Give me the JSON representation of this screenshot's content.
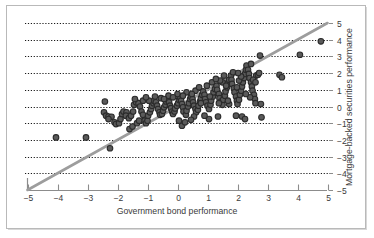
{
  "figure": {
    "background_color": "#ffffff",
    "frame_color": "#b9b9b9"
  },
  "chart_data": {
    "type": "scatter",
    "title": "",
    "xlabel": "Government bond performance",
    "ylabel": "Mortgage-backed securities performance",
    "xlim": [
      -5,
      5
    ],
    "ylim": [
      -5,
      5
    ],
    "xticks": [
      -5,
      -4,
      -3,
      -2,
      -1,
      0,
      1,
      2,
      3,
      4,
      5
    ],
    "xticklabels": [
      "−5",
      "−4",
      "−3",
      "−2",
      "−1",
      "0",
      "1",
      "2",
      "3",
      "4",
      "5"
    ],
    "yticks": [
      -5,
      -4,
      -3,
      -2,
      -1,
      0,
      1,
      2,
      3,
      4,
      5
    ],
    "yticklabels": [
      "−5",
      "−4",
      "−3",
      "−2",
      "−1",
      "0",
      "1",
      "2",
      "3",
      "4",
      "5"
    ],
    "yaxis_position": "right",
    "grid": {
      "horizontal": true,
      "vertical": false,
      "style": "dotted",
      "color": "#1a1a1a",
      "levels": [
        -4,
        -3,
        -2,
        -1,
        0,
        1,
        2,
        3,
        4,
        5
      ]
    },
    "legend": null,
    "marker": {
      "shape": "circle",
      "fill_color": "#5a5a5a",
      "edge_color": "#2b2b2b",
      "size_px": 5.6
    },
    "trendline": {
      "name": "identity-line",
      "color": "#9d9d9d",
      "width_px": 2.6,
      "slope": 1,
      "intercept": 0,
      "x_start": -5,
      "y_start": -5,
      "x_end": 5,
      "y_end": 5
    },
    "points": [
      [
        -4.05,
        -1.85
      ],
      [
        -3.05,
        -1.85
      ],
      [
        -2.42,
        0.3
      ],
      [
        -2.45,
        -0.35
      ],
      [
        -2.38,
        -0.55
      ],
      [
        -2.3,
        -0.6
      ],
      [
        -2.2,
        -0.62
      ],
      [
        -2.3,
        -0.75
      ],
      [
        -2.25,
        -2.5
      ],
      [
        -2.1,
        -0.95
      ],
      [
        -2.05,
        -1.05
      ],
      [
        -1.95,
        -1.0
      ],
      [
        -1.9,
        -0.75
      ],
      [
        -1.85,
        -0.45
      ],
      [
        -1.8,
        -0.3
      ],
      [
        -1.7,
        -0.35
      ],
      [
        -1.72,
        -0.55
      ],
      [
        -1.62,
        -0.7
      ],
      [
        -1.55,
        -0.55
      ],
      [
        -1.48,
        -0.3
      ],
      [
        -1.45,
        0.1
      ],
      [
        -1.38,
        0.25
      ],
      [
        -1.3,
        0.2
      ],
      [
        -1.25,
        0.0
      ],
      [
        -1.2,
        -0.3
      ],
      [
        -1.15,
        -0.5
      ],
      [
        -1.1,
        -0.85
      ],
      [
        -1.05,
        -1.0
      ],
      [
        -1.0,
        -0.85
      ],
      [
        -0.98,
        -0.55
      ],
      [
        -0.92,
        -0.35
      ],
      [
        -0.88,
        -0.15
      ],
      [
        -0.85,
        0.05
      ],
      [
        -0.8,
        0.2
      ],
      [
        -0.78,
        0.35
      ],
      [
        -0.72,
        0.25
      ],
      [
        -0.68,
        0.05
      ],
      [
        -0.65,
        -0.15
      ],
      [
        -0.6,
        -0.35
      ],
      [
        -0.58,
        -0.5
      ],
      [
        -0.52,
        -0.45
      ],
      [
        -0.48,
        -0.25
      ],
      [
        -0.45,
        -0.05
      ],
      [
        -0.4,
        0.1
      ],
      [
        -0.38,
        0.3
      ],
      [
        -0.32,
        0.4
      ],
      [
        -0.28,
        0.25
      ],
      [
        -0.25,
        0.05
      ],
      [
        -0.22,
        -0.1
      ],
      [
        -0.18,
        -0.3
      ],
      [
        -0.15,
        -0.45
      ],
      [
        -0.1,
        -0.3
      ],
      [
        -0.08,
        -0.12
      ],
      [
        -0.02,
        0.05
      ],
      [
        0.02,
        0.2
      ],
      [
        0.05,
        0.4
      ],
      [
        0.08,
        0.55
      ],
      [
        0.12,
        0.35
      ],
      [
        0.15,
        0.15
      ],
      [
        0.18,
        -0.05
      ],
      [
        0.2,
        -0.3
      ],
      [
        0.15,
        -1.15
      ],
      [
        0.25,
        -0.95
      ],
      [
        0.28,
        -0.5
      ],
      [
        0.3,
        -0.25
      ],
      [
        0.35,
        0.0
      ],
      [
        0.38,
        0.2
      ],
      [
        0.42,
        0.45
      ],
      [
        0.45,
        0.6
      ],
      [
        0.5,
        0.45
      ],
      [
        0.52,
        0.25
      ],
      [
        0.55,
        0.05
      ],
      [
        0.6,
        -0.15
      ],
      [
        0.62,
        -0.35
      ],
      [
        0.68,
        -0.2
      ],
      [
        0.7,
        0.05
      ],
      [
        0.75,
        0.3
      ],
      [
        0.78,
        0.5
      ],
      [
        0.82,
        0.7
      ],
      [
        0.85,
        0.9
      ],
      [
        0.9,
        0.7
      ],
      [
        0.92,
        0.45
      ],
      [
        0.95,
        0.25
      ],
      [
        1.0,
        0.05
      ],
      [
        1.05,
        -0.15
      ],
      [
        1.1,
        0.1
      ],
      [
        1.12,
        0.35
      ],
      [
        1.18,
        0.6
      ],
      [
        1.2,
        0.85
      ],
      [
        1.25,
        1.05
      ],
      [
        1.3,
        1.25
      ],
      [
        1.32,
        1.0
      ],
      [
        1.38,
        0.75
      ],
      [
        1.4,
        0.5
      ],
      [
        1.45,
        0.3
      ],
      [
        1.5,
        0.1
      ],
      [
        1.52,
        0.4
      ],
      [
        1.58,
        0.65
      ],
      [
        1.6,
        0.9
      ],
      [
        1.65,
        1.15
      ],
      [
        1.68,
        1.4
      ],
      [
        1.72,
        1.6
      ],
      [
        1.78,
        1.85
      ],
      [
        1.8,
        1.6
      ],
      [
        1.82,
        1.35
      ],
      [
        1.88,
        1.1
      ],
      [
        1.9,
        0.85
      ],
      [
        1.95,
        0.6
      ],
      [
        1.98,
        0.35
      ],
      [
        2.0,
        0.15
      ],
      [
        2.05,
        0.4
      ],
      [
        2.08,
        0.7
      ],
      [
        2.12,
        0.95
      ],
      [
        2.15,
        1.2
      ],
      [
        2.18,
        1.45
      ],
      [
        2.22,
        1.7
      ],
      [
        2.25,
        1.95
      ],
      [
        2.28,
        2.2
      ],
      [
        2.3,
        2.45
      ],
      [
        2.35,
        2.2
      ],
      [
        2.38,
        1.95
      ],
      [
        2.4,
        1.7
      ],
      [
        2.45,
        1.45
      ],
      [
        2.48,
        1.2
      ],
      [
        2.5,
        0.95
      ],
      [
        2.55,
        0.7
      ],
      [
        2.58,
        0.45
      ],
      [
        2.6,
        0.2
      ],
      [
        2.62,
        1.85
      ],
      [
        2.68,
        1.9
      ],
      [
        2.72,
        2.0
      ],
      [
        2.75,
        3.05
      ],
      [
        2.78,
        0.15
      ],
      [
        2.8,
        -0.65
      ],
      [
        1.72,
        0.15
      ],
      [
        1.95,
        -0.55
      ],
      [
        2.15,
        -0.6
      ],
      [
        2.25,
        -0.75
      ],
      [
        1.35,
        -0.6
      ],
      [
        1.05,
        -0.75
      ],
      [
        0.9,
        -0.55
      ],
      [
        0.55,
        -0.6
      ],
      [
        3.4,
        1.9
      ],
      [
        3.48,
        1.75
      ],
      [
        4.08,
        3.1
      ],
      [
        4.78,
        3.9
      ],
      [
        -1.6,
        -1.35
      ],
      [
        -1.5,
        -1.2
      ],
      [
        -1.35,
        -1.0
      ],
      [
        -1.28,
        -0.85
      ],
      [
        0.45,
        -0.8
      ],
      [
        0.05,
        -0.85
      ],
      [
        1.5,
        1.45
      ],
      [
        1.62,
        1.25
      ],
      [
        1.42,
        1.55
      ],
      [
        2.05,
        1.55
      ],
      [
        2.12,
        1.8
      ],
      [
        2.42,
        0.55
      ],
      [
        2.52,
        1.6
      ],
      [
        2.6,
        1.45
      ],
      [
        -0.55,
        0.5
      ],
      [
        -0.3,
        0.65
      ],
      [
        0.0,
        0.75
      ],
      [
        0.3,
        0.85
      ],
      [
        0.6,
        0.95
      ],
      [
        0.72,
        1.15
      ],
      [
        1.15,
        1.45
      ],
      [
        0.98,
        1.25
      ],
      [
        1.28,
        1.65
      ],
      [
        1.55,
        1.85
      ],
      [
        1.85,
        2.05
      ],
      [
        2.02,
        2.0
      ],
      [
        -0.95,
        0.35
      ],
      [
        -1.15,
        0.35
      ],
      [
        -1.42,
        0.45
      ],
      [
        -1.05,
        0.55
      ],
      [
        -0.75,
        0.6
      ],
      [
        -0.45,
        0.45
      ],
      [
        -0.15,
        0.55
      ],
      [
        0.18,
        0.65
      ],
      [
        0.48,
        0.75
      ],
      [
        0.78,
        0.2
      ],
      [
        1.08,
        0.6
      ],
      [
        1.38,
        0.2
      ],
      [
        1.68,
        0.35
      ],
      [
        1.98,
        1.15
      ],
      [
        2.28,
        0.75
      ],
      [
        2.45,
        2.55
      ]
    ]
  }
}
